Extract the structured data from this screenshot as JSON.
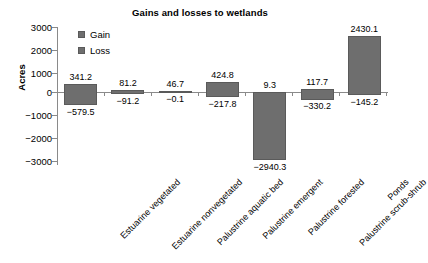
{
  "chart_data": {
    "type": "bar",
    "title": "Gains and losses to wetlands",
    "xlabel": "",
    "ylabel": "Acres",
    "ylim": [
      -3000,
      3000
    ],
    "yticks": [
      3000,
      2000,
      1000,
      0,
      -1000,
      -2000,
      -3000
    ],
    "ytick_labels": [
      "3000",
      "2000",
      "1000",
      "0",
      "−1000",
      "−2000",
      "−3000"
    ],
    "grid": false,
    "legend_position": "upper-left-inside",
    "bar_color": "#6e6e6e",
    "axis_color": "#8a8a8a",
    "categories": [
      "Estuarine vegetated",
      "Estuarine nonvegetated",
      "Palustrine aquatic bed",
      "Palustrine emergent",
      "Palustrine forested",
      "Palustrine scrub-shrub",
      "Ponds"
    ],
    "series": [
      {
        "name": "Gain",
        "values": [
          341.2,
          81.2,
          46.7,
          424.8,
          9.3,
          117.7,
          2430.1
        ],
        "labels": [
          "341.2",
          "81.2",
          "46.7",
          "424.8",
          "9.3",
          "117.7",
          "2430.1"
        ]
      },
      {
        "name": "Loss",
        "values": [
          -579.5,
          -91.2,
          -0.1,
          -217.8,
          -2940.3,
          -330.2,
          -145.2
        ],
        "labels": [
          "−579.5",
          "−91.2",
          "−0.1",
          "−217.8",
          "−2940.3",
          "−330.2",
          "−145.2"
        ]
      }
    ],
    "legend": [
      "Gain",
      "Loss"
    ]
  }
}
